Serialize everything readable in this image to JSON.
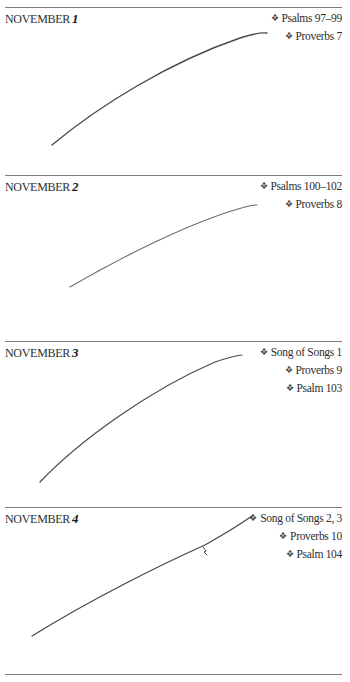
{
  "entries": [
    {
      "month": "NOVEMBER",
      "day": "1",
      "readings": [
        "Psalms 97–99",
        "Proverbs 7"
      ]
    },
    {
      "month": "NOVEMBER",
      "day": "2",
      "readings": [
        "Psalms 100–102",
        "Proverbs 8"
      ]
    },
    {
      "month": "NOVEMBER",
      "day": "3",
      "readings": [
        "Song of Songs 1",
        "Proverbs 9",
        "Psalm 103"
      ]
    },
    {
      "month": "NOVEMBER",
      "day": "4",
      "readings": [
        "Song of Songs 2, 3",
        "Proverbs 10",
        "Psalm 104"
      ]
    }
  ],
  "bullet_glyph": "❖",
  "colors": {
    "rule": "#7d7d7d",
    "text": "#2e2e2e",
    "pen_stroke": "#4a4a4a"
  }
}
